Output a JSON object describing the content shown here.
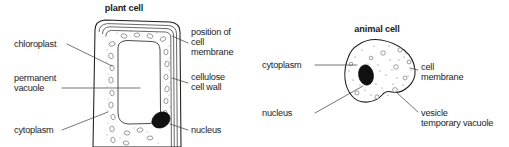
{
  "figure": {
    "background_color": "#ffffff",
    "ink_color": "#1c1c1c",
    "leader_color": "#3a3a3a",
    "nucleus_color": "#111111"
  },
  "plant_cell": {
    "title": "plant cell",
    "labels": {
      "chloroplast": "chloroplast",
      "permanent_vacuole_line1": "permanent",
      "permanent_vacuole_line2": "vacuole",
      "cytoplasm": "cytoplasm",
      "cell_membrane_line1": "position of",
      "cell_membrane_line2": "cell",
      "cell_membrane_line3": "membrane",
      "cell_wall_line1": "cellulose",
      "cell_wall_line2": "cell wall",
      "nucleus": "nucleus"
    }
  },
  "animal_cell": {
    "title": "animal cell",
    "labels": {
      "cytoplasm": "cytoplasm",
      "nucleus": "nucleus",
      "cell_membrane_line1": "cell",
      "cell_membrane_line2": "membrane",
      "vesicle_line1": "vesicle",
      "vesicle_line2": "temporary vacuole"
    }
  }
}
